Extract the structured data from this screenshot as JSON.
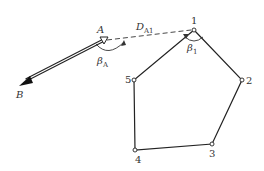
{
  "diagram": {
    "title": "",
    "points": [
      {
        "id": "A",
        "label": "A",
        "x": 104,
        "y": 41,
        "type": "known-station"
      },
      {
        "id": "B",
        "label": "B",
        "x": 20,
        "y": 85,
        "type": "orientation-point"
      },
      {
        "id": "1",
        "label": "1",
        "x": 194,
        "y": 30
      },
      {
        "id": "2",
        "label": "2",
        "x": 242,
        "y": 80
      },
      {
        "id": "3",
        "label": "3",
        "x": 212,
        "y": 144
      },
      {
        "id": "4",
        "label": "4",
        "x": 135,
        "y": 150
      },
      {
        "id": "5",
        "label": "5",
        "x": 134,
        "y": 80
      }
    ],
    "polygon_order": [
      "1",
      "2",
      "3",
      "4",
      "5"
    ],
    "connection": {
      "from": "A",
      "to": "1",
      "label": "D",
      "subscript": "A1",
      "style": "dashed"
    },
    "direction": {
      "from": "A",
      "to": "B",
      "style": "double-line-arrow"
    },
    "angles": [
      {
        "at": "A",
        "label": "β",
        "subscript": "A"
      },
      {
        "at": "1",
        "label": "β",
        "subscript": "1"
      }
    ]
  }
}
